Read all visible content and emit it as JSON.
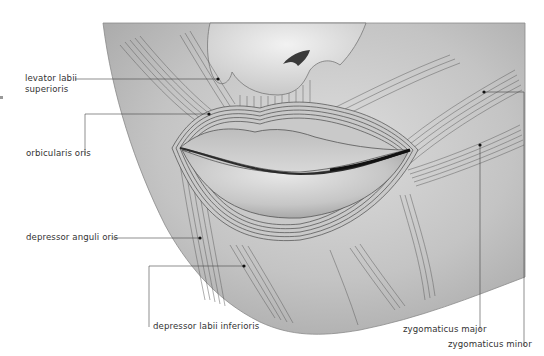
{
  "figure": {
    "colors": {
      "skin": "#b9b9b9",
      "skin_light": "#d8d8d8",
      "muscle_line": "#555555",
      "lip": "#cfcfcf",
      "leader": "#444444",
      "label_text": "#333333"
    }
  },
  "labels": [
    {
      "id": "levator_labii_superioris",
      "line1": "levator labii",
      "line2": "superioris"
    },
    {
      "id": "orbicularis_oris",
      "text": "orbicularis oris"
    },
    {
      "id": "depressor_anguli_oris",
      "text": "depressor anguli oris"
    },
    {
      "id": "depressor_labii_inferioris",
      "text": "depressor labii inferioris"
    },
    {
      "id": "zygomaticus_major",
      "text": "zygomaticus major"
    },
    {
      "id": "zygomaticus_minor",
      "text": "zygomaticus minor"
    }
  ]
}
